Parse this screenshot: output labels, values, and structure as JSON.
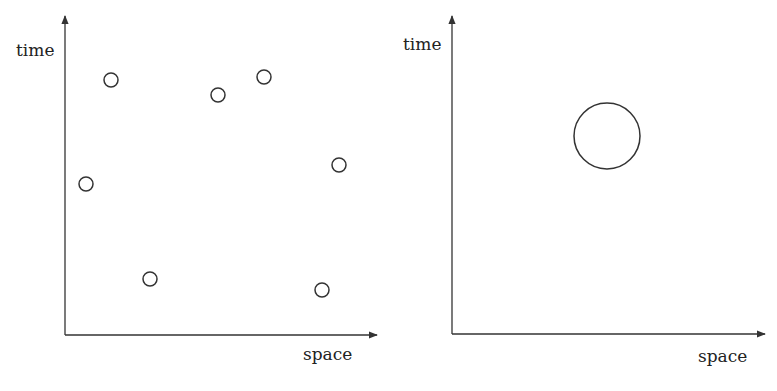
{
  "panels": [
    {
      "id": "left",
      "y_label": "time",
      "x_label": "space",
      "axis": {
        "origin": [
          65,
          335
        ],
        "x_end": 377,
        "y_end": 16
      },
      "label_pos": {
        "y": [
          16,
          56
        ],
        "x": [
          303,
          360
        ]
      },
      "circles": [
        {
          "cx": 111,
          "cy": 80,
          "r": 7
        },
        {
          "cx": 86,
          "cy": 184,
          "r": 7
        },
        {
          "cx": 150,
          "cy": 279,
          "r": 7
        },
        {
          "cx": 218,
          "cy": 95,
          "r": 7
        },
        {
          "cx": 264,
          "cy": 77,
          "r": 7
        },
        {
          "cx": 339,
          "cy": 165,
          "r": 7
        },
        {
          "cx": 322,
          "cy": 290,
          "r": 7
        }
      ]
    },
    {
      "id": "right",
      "y_label": "time",
      "x_label": "space",
      "axis": {
        "origin": [
          452,
          334
        ],
        "x_end": 765,
        "y_end": 16
      },
      "label_pos": {
        "y": [
          403,
          50
        ],
        "x": [
          698,
          362
        ]
      },
      "circles": [
        {
          "cx": 607,
          "cy": 136,
          "r": 33
        }
      ]
    }
  ],
  "colors": {
    "ink": "#333333",
    "background": "#ffffff"
  }
}
